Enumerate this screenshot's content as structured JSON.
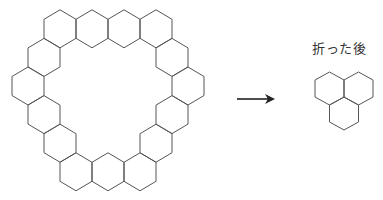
{
  "diagram": {
    "colors": {
      "stroke": "#555555",
      "arrow": "#222222",
      "text": "#333333"
    },
    "before": {
      "hex_half_width": 16,
      "hex_tip": 19,
      "hex_side_half": 9.5,
      "rows": [
        {
          "y": 28.8,
          "x": [
            60,
            92,
            124,
            156
          ]
        },
        {
          "y": 57.4,
          "x": [
            44,
            172
          ]
        },
        {
          "y": 86.0,
          "x": [
            28,
            188
          ]
        },
        {
          "y": 114.6,
          "x": [
            44,
            172
          ]
        },
        {
          "y": 143.2,
          "x": [
            60,
            156
          ]
        },
        {
          "y": 171.8,
          "x": [
            76,
            108,
            140
          ]
        }
      ],
      "hex_count": 15
    },
    "arrow": {
      "x1": 237,
      "x2": 275,
      "y": 99,
      "symbol": "→"
    },
    "after": {
      "label": "折った後",
      "hex_half_width": 14.5,
      "hex_tip": 16.5,
      "hex_side_half": 8.5,
      "centers": [
        [
          329.5,
          88.5
        ],
        [
          358.5,
          88.5
        ],
        [
          344,
          113.5
        ]
      ],
      "hex_count": 3
    }
  }
}
